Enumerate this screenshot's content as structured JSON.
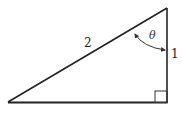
{
  "diagram": {
    "type": "right-triangle",
    "labels": {
      "hypotenuse": "2",
      "vertical_side": "1",
      "angle": "θ"
    },
    "colors": {
      "stroke": "#222222",
      "background": "#ffffff"
    }
  }
}
